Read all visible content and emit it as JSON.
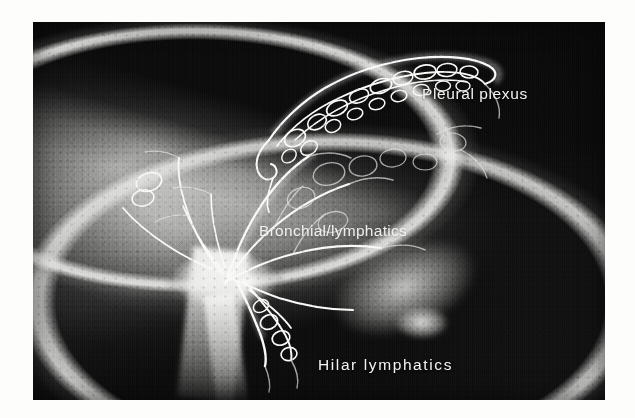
{
  "figure": {
    "kind": "radiograph-lymphangiogram",
    "modality_note": "black-and-white lung lymphangiogram photographic print",
    "print": {
      "background_color": "#fdfdfc",
      "film_color": "#0d0d0d",
      "highlight_color": "#ffffff",
      "plate_left": 33,
      "plate_top": 22,
      "plate_width": 572,
      "plate_height": 378
    },
    "labels": [
      {
        "id": "pleural",
        "text": "Pleural plexus",
        "color": "#f2f2f0",
        "x": 389,
        "y": 63
      },
      {
        "id": "bronchial",
        "text": "Bronchial/lymphatics",
        "color": "#f6f6f4",
        "x": 226,
        "y": 200
      },
      {
        "id": "hilar",
        "text": "Hilar lymphatics",
        "color": "#f4f4f2",
        "x": 285,
        "y": 334
      }
    ],
    "regions": [
      {
        "name": "pleural-plexus-mesh",
        "description": "dense tangled bright loops along upper convex pleural surface"
      },
      {
        "name": "bronchial-lymphatic-network",
        "description": "branching polygonal channels radiating from hilum through mid lung"
      },
      {
        "name": "hilum",
        "description": "intense bright opacity with descending stalk at lower left of center"
      },
      {
        "name": "lung-parenchyma",
        "description": "mottled granular mid-gray lung field"
      },
      {
        "name": "background-field",
        "description": "dark film background surrounding the lung"
      }
    ]
  }
}
